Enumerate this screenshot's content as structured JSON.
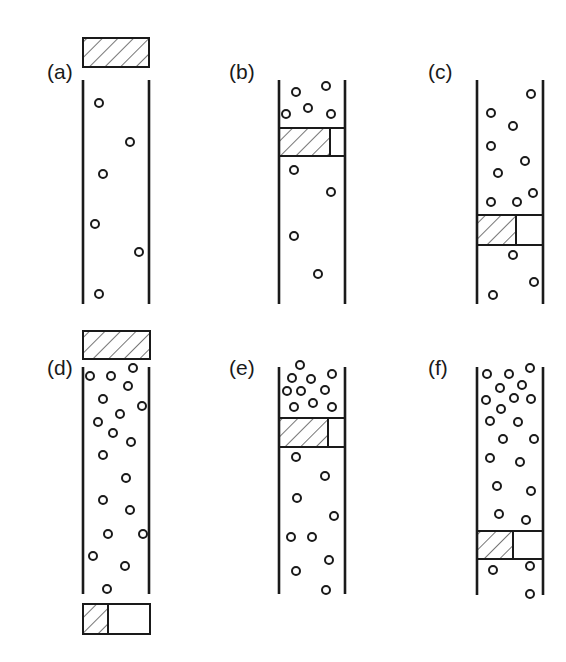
{
  "figure": {
    "stroke_color": "#1a1a1a",
    "background": "#ffffff",
    "particle_radius": 4,
    "panels": [
      {
        "id": "a",
        "label": "(a)",
        "label_pos": [
          47,
          74
        ],
        "tube": {
          "left": 83,
          "right": 149,
          "top": 80,
          "bottom": 304
        },
        "pistons": [
          {
            "x": 83,
            "y": 38,
            "w": 66,
            "h": 29,
            "hatch_w": 66
          }
        ],
        "particles": [
          [
            99,
            103
          ],
          [
            130,
            142
          ],
          [
            103,
            174
          ],
          [
            95,
            224
          ],
          [
            139,
            252
          ],
          [
            99,
            294
          ]
        ]
      },
      {
        "id": "b",
        "label": "(b)",
        "label_pos": [
          229,
          74
        ],
        "tube": {
          "left": 279,
          "right": 345,
          "top": 80,
          "bottom": 304
        },
        "pistons": [
          {
            "x": 279,
            "y": 128,
            "w": 66,
            "h": 28,
            "hatch_w": 51
          }
        ],
        "particles": [
          [
            296,
            92
          ],
          [
            326,
            86
          ],
          [
            286,
            114
          ],
          [
            308,
            108
          ],
          [
            331,
            114
          ],
          [
            294,
            170
          ],
          [
            331,
            192
          ],
          [
            294,
            236
          ],
          [
            318,
            274
          ]
        ]
      },
      {
        "id": "c",
        "label": "(c)",
        "label_pos": [
          428,
          74
        ],
        "tube": {
          "left": 477,
          "right": 543,
          "top": 80,
          "bottom": 304
        },
        "pistons": [
          {
            "x": 477,
            "y": 215,
            "w": 66,
            "h": 30,
            "hatch_w": 39
          }
        ],
        "particles": [
          [
            531,
            94
          ],
          [
            491,
            113
          ],
          [
            513,
            126
          ],
          [
            491,
            146
          ],
          [
            525,
            161
          ],
          [
            498,
            173
          ],
          [
            517,
            202
          ],
          [
            491,
            202
          ],
          [
            533,
            193
          ],
          [
            513,
            255
          ],
          [
            534,
            282
          ],
          [
            493,
            295
          ]
        ]
      },
      {
        "id": "d",
        "label": "(d)",
        "label_pos": [
          47,
          370
        ],
        "tube": {
          "left": 83,
          "right": 149,
          "top": 367,
          "bottom": 594
        },
        "pistons": [
          {
            "x": 83,
            "y": 331,
            "w": 67,
            "h": 28,
            "hatch_w": 67
          },
          {
            "x": 83,
            "y": 604,
            "w": 67,
            "h": 30,
            "hatch_w": 25
          }
        ],
        "particles": [
          [
            90,
            376
          ],
          [
            111,
            376
          ],
          [
            133,
            368
          ],
          [
            128,
            386
          ],
          [
            103,
            399
          ],
          [
            142,
            406
          ],
          [
            120,
            414
          ],
          [
            98,
            422
          ],
          [
            113,
            433
          ],
          [
            131,
            442
          ],
          [
            103,
            455
          ],
          [
            126,
            478
          ],
          [
            103,
            500
          ],
          [
            130,
            510
          ],
          [
            108,
            534
          ],
          [
            143,
            534
          ],
          [
            93,
            556
          ],
          [
            125,
            566
          ],
          [
            107,
            589
          ]
        ]
      },
      {
        "id": "e",
        "label": "(e)",
        "label_pos": [
          229,
          370
        ],
        "tube": {
          "left": 279,
          "right": 345,
          "top": 367,
          "bottom": 594
        },
        "pistons": [
          {
            "x": 279,
            "y": 418,
            "w": 66,
            "h": 29,
            "hatch_w": 49
          }
        ],
        "particles": [
          [
            300,
            365
          ],
          [
            292,
            378
          ],
          [
            311,
            379
          ],
          [
            332,
            374
          ],
          [
            287,
            391
          ],
          [
            301,
            391
          ],
          [
            325,
            390
          ],
          [
            294,
            407
          ],
          [
            313,
            403
          ],
          [
            332,
            407
          ],
          [
            296,
            457
          ],
          [
            325,
            476
          ],
          [
            297,
            498
          ],
          [
            334,
            516
          ],
          [
            291,
            537
          ],
          [
            312,
            537
          ],
          [
            329,
            560
          ],
          [
            296,
            571
          ],
          [
            326,
            590
          ]
        ]
      },
      {
        "id": "f",
        "label": "(f)",
        "label_pos": [
          428,
          370
        ],
        "tube": {
          "left": 477,
          "right": 543,
          "top": 367,
          "bottom": 595
        },
        "pistons": [
          {
            "x": 477,
            "y": 531,
            "w": 66,
            "h": 28,
            "hatch_w": 36
          }
        ],
        "particles": [
          [
            487,
            374
          ],
          [
            509,
            374
          ],
          [
            530,
            368
          ],
          [
            500,
            388
          ],
          [
            522,
            385
          ],
          [
            486,
            400
          ],
          [
            514,
            398
          ],
          [
            531,
            399
          ],
          [
            501,
            409
          ],
          [
            490,
            421
          ],
          [
            518,
            422
          ],
          [
            503,
            439
          ],
          [
            534,
            439
          ],
          [
            490,
            458
          ],
          [
            520,
            462
          ],
          [
            497,
            486
          ],
          [
            531,
            491
          ],
          [
            499,
            514
          ],
          [
            526,
            520
          ],
          [
            493,
            570
          ],
          [
            530,
            566
          ],
          [
            530,
            594
          ]
        ]
      }
    ]
  }
}
